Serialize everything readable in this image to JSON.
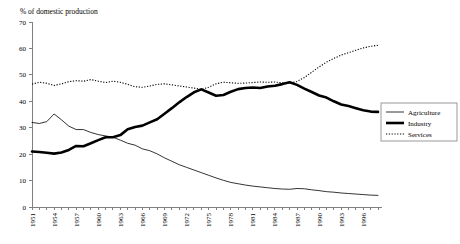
{
  "chart_data": {
    "type": "line",
    "title": "% of domestic production",
    "xlabel": "",
    "ylabel": "",
    "ylim": [
      0,
      70
    ],
    "ytick_step": 10,
    "yticks": [
      0,
      10,
      20,
      30,
      40,
      50,
      60,
      70
    ],
    "xlim": [
      1951,
      1998
    ],
    "xtick_step": 1,
    "xtick_labels": [
      "1951",
      "1954",
      "1957",
      "1960",
      "1963",
      "1966",
      "1969",
      "1972",
      "1975",
      "1978",
      "1981",
      "1984",
      "1987",
      "1990",
      "1993",
      "1996"
    ],
    "xtick_label_years": [
      1951,
      1954,
      1957,
      1960,
      1963,
      1966,
      1969,
      1972,
      1975,
      1978,
      1981,
      1984,
      1987,
      1990,
      1993,
      1996
    ],
    "xtick_label_rotation": -90,
    "grid": false,
    "legend_position": "right",
    "x": [
      1951,
      1952,
      1953,
      1954,
      1955,
      1956,
      1957,
      1958,
      1959,
      1960,
      1961,
      1962,
      1963,
      1964,
      1965,
      1966,
      1967,
      1968,
      1969,
      1970,
      1971,
      1972,
      1973,
      1974,
      1975,
      1976,
      1977,
      1978,
      1979,
      1980,
      1981,
      1982,
      1983,
      1984,
      1985,
      1986,
      1987,
      1988,
      1989,
      1990,
      1991,
      1992,
      1993,
      1994,
      1995,
      1996,
      1997,
      1998
    ],
    "series": [
      {
        "name": "Agriculture",
        "color": "#000000",
        "style": "thin-solid",
        "values": [
          32.0,
          31.6,
          32.3,
          35.2,
          33.0,
          30.6,
          29.3,
          29.3,
          28.2,
          27.4,
          26.9,
          26.4,
          25.3,
          24.1,
          23.4,
          22.0,
          21.3,
          20.1,
          18.6,
          17.3,
          16.0,
          15.0,
          14.0,
          13.0,
          12.0,
          11.0,
          10.1,
          9.3,
          8.8,
          8.3,
          7.9,
          7.6,
          7.3,
          7.0,
          6.8,
          6.7,
          7.0,
          6.9,
          6.5,
          6.2,
          5.8,
          5.6,
          5.3,
          5.1,
          4.9,
          4.7,
          4.5,
          4.4
        ]
      },
      {
        "name": "Industry",
        "color": "#000000",
        "style": "thick-solid",
        "values": [
          21.0,
          20.8,
          20.5,
          20.2,
          20.6,
          21.6,
          23.1,
          23.0,
          24.1,
          25.3,
          26.4,
          26.4,
          27.2,
          29.4,
          30.3,
          30.8,
          32.0,
          33.2,
          35.3,
          37.4,
          39.6,
          41.6,
          43.4,
          44.5,
          43.3,
          42.1,
          42.4,
          43.6,
          44.6,
          45.0,
          45.2,
          45.0,
          45.6,
          45.9,
          46.5,
          47.2,
          46.2,
          44.8,
          43.5,
          42.2,
          41.4,
          40.0,
          38.8,
          38.2,
          37.4,
          36.6,
          36.1,
          36.0
        ]
      },
      {
        "name": "Services",
        "color": "#000000",
        "style": "dotted",
        "values": [
          46.5,
          47.2,
          46.8,
          46.0,
          46.6,
          47.4,
          47.8,
          47.6,
          48.2,
          47.6,
          47.1,
          47.6,
          47.2,
          46.4,
          45.5,
          45.3,
          45.8,
          46.4,
          46.6,
          46.2,
          45.8,
          45.4,
          45.0,
          44.5,
          45.3,
          46.6,
          47.2,
          47.0,
          46.8,
          46.9,
          47.1,
          47.3,
          47.2,
          47.3,
          47.0,
          46.8,
          47.5,
          49.0,
          51.0,
          53.0,
          54.8,
          56.2,
          57.5,
          58.4,
          59.3,
          60.2,
          60.8,
          61.2
        ]
      }
    ],
    "legend": [
      {
        "label": "Agriculture",
        "style": "thin-solid"
      },
      {
        "label": "Industry",
        "style": "thick-solid"
      },
      {
        "label": "Services",
        "style": "dotted"
      }
    ]
  }
}
